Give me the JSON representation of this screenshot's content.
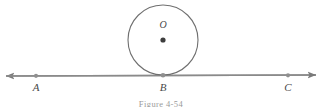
{
  "figure": {
    "caption": "Figure 4-54",
    "background_color": "#ffffff",
    "stroke_color": "#7a7a7a",
    "label_color": "#4a4a4a",
    "labels": {
      "center": "O",
      "point_a": "A",
      "point_b": "B",
      "point_c": "C"
    },
    "geometry": {
      "circle": {
        "cx": 163,
        "cy": 40,
        "r": 35
      },
      "line": {
        "x1": 6,
        "y1": 76,
        "x2": 316,
        "y2": 75
      },
      "points": [
        {
          "name": "A",
          "x": 36,
          "y": 75.8
        },
        {
          "name": "B",
          "x": 163,
          "y": 75.2
        },
        {
          "name": "C",
          "x": 288,
          "y": 75.3
        }
      ],
      "center_dot": {
        "x": 163,
        "y": 40,
        "r": 2.6
      },
      "arrowheads": [
        "left",
        "right"
      ]
    }
  }
}
